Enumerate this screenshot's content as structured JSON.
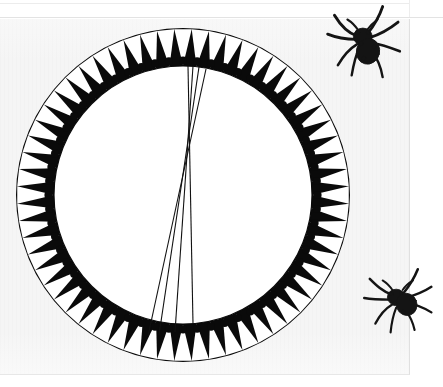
{
  "document": {
    "title": "Engraved circular dial plate with radial index lines",
    "page_background": "#f5f5f5",
    "paper_edge_color": "#e0e0e0",
    "ink_color": "#0a0a0a"
  },
  "figure": {
    "name": "toothed-dial-ring",
    "caption": "",
    "center": {
      "x": 183,
      "y": 176
    },
    "outer_radius": 167,
    "inner_radius": 129,
    "ring_fill": "#0a0a0a",
    "tooth_fill": "#ffffff",
    "tooth_count": 60,
    "tooth_dot_color": "#0a0a0a",
    "tooth_dot_radius": 4.0,
    "inner_disc_fill": "#ffffff",
    "tooth_description": "white inward-pointing dart with a black bead at its inner tip"
  },
  "index_lines": {
    "name": "converging-index-lines",
    "count": 4,
    "stroke": "#111111",
    "stroke_width": 1.1,
    "apex": {
      "x": 195,
      "y": 136
    },
    "lines": [
      {
        "id": "line-1",
        "x1": 188,
        "y1": 47,
        "x2": 193,
        "y2": 305
      },
      {
        "id": "line-2",
        "x1": 193,
        "y1": 47,
        "x2": 175,
        "y2": 313
      },
      {
        "id": "line-3",
        "x1": 199,
        "y1": 48,
        "x2": 159,
        "y2": 316
      },
      {
        "id": "line-4",
        "x1": 206,
        "y1": 50,
        "x2": 148,
        "y2": 317
      }
    ]
  },
  "specimens": [
    {
      "id": "spider-top",
      "name": "spider-specimen-top-right",
      "label": "",
      "body_color": "#141414",
      "leg_color": "#1a1a1a"
    },
    {
      "id": "spider-right",
      "name": "spider-specimen-mid-right",
      "label": "",
      "body_color": "#141414",
      "leg_color": "#1a1a1a"
    }
  ],
  "chart_data": {
    "type": "scatter",
    "xlabel": "",
    "ylabel": "",
    "categories": [],
    "values": [],
    "annotations": [
      "60 radial white darts around a black annulus",
      "each dart carries a black bead at the inner tip",
      "four thin straight index lines cross the inner white disc",
      "lines converge near the upper third of the disc"
    ]
  }
}
